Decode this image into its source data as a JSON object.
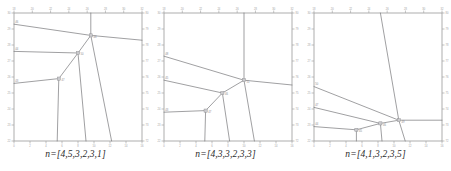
{
  "figure": {
    "panel_count": 3,
    "background_color": "#ffffff",
    "line_color": "#77777a",
    "frame_color": "#9a9a9a",
    "tick_label_color": "#9d9d9d"
  },
  "chart_data": [
    {
      "type": "line",
      "title": "n=[4,5,3,2,3,1]",
      "caption": "n=[4,5,3,2,3,1]",
      "xlabel": "",
      "ylabel": "",
      "grid": false,
      "legend": "none",
      "xlim": [
        0,
        16
      ],
      "ylim": [
        22,
        30
      ],
      "x_ticks_bottom": [
        0,
        2,
        4,
        6,
        8,
        10,
        12,
        14,
        16
      ],
      "x_ticks_top": [
        18,
        20,
        22,
        24,
        26,
        28,
        30,
        32
      ],
      "y_ticks_left": [
        30,
        29,
        28,
        27,
        26,
        25,
        24,
        23,
        22
      ],
      "y_ticks_right": [
        80,
        79,
        78,
        77,
        76,
        75,
        74,
        73,
        72
      ],
      "nodes": [
        {
          "label": "46",
          "x": 0.0,
          "y": 29.3
        },
        {
          "label": "44",
          "x": 0.0,
          "y": 27.6
        },
        {
          "label": "43",
          "x": 0.0,
          "y": 25.6
        },
        {
          "label": "48",
          "x": 9.6,
          "y": 28.6
        },
        {
          "label": "50",
          "x": 8.0,
          "y": 27.5
        },
        {
          "label": "47",
          "x": 5.6,
          "y": 25.9
        },
        {
          "label": "top",
          "x": 9.6,
          "y": 30.0
        },
        {
          "label": "right",
          "x": 16.0,
          "y": 28.3
        },
        {
          "label": "b1",
          "x": 5.4,
          "y": 22.0
        },
        {
          "label": "b2",
          "x": 9.0,
          "y": 22.0
        },
        {
          "label": "b3",
          "x": 12.2,
          "y": 22.0
        }
      ],
      "edges": [
        {
          "from": [
            0.0,
            29.3
          ],
          "to": [
            9.6,
            28.6
          ]
        },
        {
          "from": [
            9.6,
            28.6
          ],
          "to": [
            16.0,
            28.3
          ]
        },
        {
          "from": [
            9.6,
            28.6
          ],
          "to": [
            9.6,
            30.0
          ]
        },
        {
          "from": [
            9.6,
            28.6
          ],
          "to": [
            8.0,
            27.5
          ]
        },
        {
          "from": [
            9.6,
            28.6
          ],
          "to": [
            12.2,
            22.0
          ]
        },
        {
          "from": [
            0.0,
            27.6
          ],
          "to": [
            8.0,
            27.5
          ]
        },
        {
          "from": [
            8.0,
            27.5
          ],
          "to": [
            5.6,
            25.9
          ]
        },
        {
          "from": [
            8.0,
            27.5
          ],
          "to": [
            9.0,
            22.0
          ]
        },
        {
          "from": [
            0.0,
            25.6
          ],
          "to": [
            5.6,
            25.9
          ]
        },
        {
          "from": [
            5.6,
            25.9
          ],
          "to": [
            5.4,
            22.0
          ]
        }
      ]
    },
    {
      "type": "line",
      "title": "n=[4,3,3,2,3,3]",
      "caption": "n=[4,3,3,2,3,3]",
      "xlabel": "",
      "ylabel": "",
      "grid": false,
      "legend": "none",
      "xlim": [
        0,
        16
      ],
      "ylim": [
        22,
        30
      ],
      "x_ticks_bottom": [
        0,
        2,
        4,
        6,
        8,
        10,
        12,
        14,
        16
      ],
      "x_ticks_top": [
        18,
        20,
        22,
        24,
        26,
        28,
        30,
        32
      ],
      "y_ticks_left": [
        30,
        29,
        28,
        27,
        26,
        25,
        24,
        23,
        22
      ],
      "y_ticks_right": [
        80,
        79,
        78,
        77,
        76,
        75,
        74,
        73,
        72
      ],
      "nodes": [
        {
          "label": "48",
          "x": 0.0,
          "y": 27.3
        },
        {
          "label": "45",
          "x": 0.0,
          "y": 25.8
        },
        {
          "label": "43",
          "x": 0.0,
          "y": 23.8
        },
        {
          "label": "51",
          "x": 10.0,
          "y": 25.8
        },
        {
          "label": "46",
          "x": 7.3,
          "y": 25.0
        },
        {
          "label": "47",
          "x": 5.2,
          "y": 23.9
        },
        {
          "label": "top",
          "x": 10.0,
          "y": 30.0
        },
        {
          "label": "right",
          "x": 16.0,
          "y": 25.5
        },
        {
          "label": "b1",
          "x": 5.1,
          "y": 22.0
        },
        {
          "label": "b2",
          "x": 8.2,
          "y": 22.0
        },
        {
          "label": "b3",
          "x": 11.3,
          "y": 22.0
        }
      ],
      "edges": [
        {
          "from": [
            0.0,
            27.3
          ],
          "to": [
            10.0,
            25.8
          ]
        },
        {
          "from": [
            10.0,
            25.8
          ],
          "to": [
            16.0,
            25.5
          ]
        },
        {
          "from": [
            10.0,
            25.8
          ],
          "to": [
            10.0,
            30.0
          ]
        },
        {
          "from": [
            10.0,
            25.8
          ],
          "to": [
            7.3,
            25.0
          ]
        },
        {
          "from": [
            10.0,
            25.8
          ],
          "to": [
            11.3,
            22.0
          ]
        },
        {
          "from": [
            0.0,
            25.8
          ],
          "to": [
            7.3,
            25.0
          ]
        },
        {
          "from": [
            7.3,
            25.0
          ],
          "to": [
            5.2,
            23.9
          ]
        },
        {
          "from": [
            7.3,
            25.0
          ],
          "to": [
            8.2,
            22.0
          ]
        },
        {
          "from": [
            0.0,
            23.8
          ],
          "to": [
            5.2,
            23.9
          ]
        },
        {
          "from": [
            5.2,
            23.9
          ],
          "to": [
            5.1,
            22.0
          ]
        }
      ]
    },
    {
      "type": "line",
      "title": "n=[4,1,3,2,3,5]",
      "caption": "n=[4,1,3,2,3,5]",
      "xlabel": "",
      "ylabel": "",
      "grid": false,
      "legend": "none",
      "xlim": [
        0,
        16
      ],
      "ylim": [
        22,
        30
      ],
      "x_ticks_bottom": [
        0,
        2,
        4,
        6,
        8,
        10,
        12,
        14,
        16
      ],
      "x_ticks_top": [
        18,
        20,
        22,
        24,
        26,
        28,
        30,
        32
      ],
      "y_ticks_left": [
        30,
        29,
        28,
        27,
        26,
        25,
        24,
        23,
        22
      ],
      "y_ticks_right": [
        80,
        79,
        78,
        77,
        76,
        75,
        74,
        73,
        72
      ],
      "nodes": [
        {
          "label": "50",
          "x": 0.0,
          "y": 25.4
        },
        {
          "label": "47",
          "x": 0.0,
          "y": 24.1
        },
        {
          "label": "44",
          "x": 0.0,
          "y": 22.9
        },
        {
          "label": "49",
          "x": 10.6,
          "y": 23.3
        },
        {
          "label": "46",
          "x": 8.3,
          "y": 23.1
        },
        {
          "label": "45",
          "x": 5.3,
          "y": 22.7
        },
        {
          "label": "top",
          "x": 8.3,
          "y": 30.0
        },
        {
          "label": "right",
          "x": 16.0,
          "y": 23.3
        },
        {
          "label": "b1",
          "x": 5.3,
          "y": 22.0
        },
        {
          "label": "b2",
          "x": 8.5,
          "y": 22.0
        },
        {
          "label": "b3",
          "x": 11.4,
          "y": 22.0
        }
      ],
      "edges": [
        {
          "from": [
            0.0,
            25.4
          ],
          "to": [
            10.6,
            23.3
          ]
        },
        {
          "from": [
            10.6,
            23.3
          ],
          "to": [
            16.0,
            23.3
          ]
        },
        {
          "from": [
            10.6,
            23.3
          ],
          "to": [
            8.3,
            30.0
          ]
        },
        {
          "from": [
            10.6,
            23.3
          ],
          "to": [
            8.3,
            23.1
          ]
        },
        {
          "from": [
            10.6,
            23.3
          ],
          "to": [
            11.4,
            22.0
          ]
        },
        {
          "from": [
            0.0,
            24.1
          ],
          "to": [
            8.3,
            23.1
          ]
        },
        {
          "from": [
            8.3,
            23.1
          ],
          "to": [
            5.3,
            22.7
          ]
        },
        {
          "from": [
            8.3,
            23.1
          ],
          "to": [
            8.5,
            22.0
          ]
        },
        {
          "from": [
            0.0,
            22.9
          ],
          "to": [
            5.3,
            22.7
          ]
        },
        {
          "from": [
            5.3,
            22.7
          ],
          "to": [
            5.3,
            22.0
          ]
        }
      ]
    }
  ]
}
